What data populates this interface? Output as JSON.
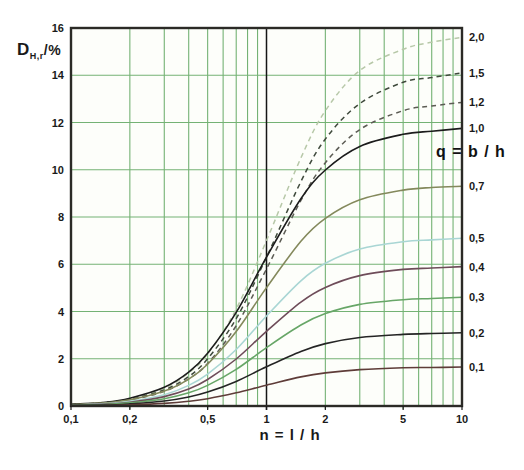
{
  "figure": {
    "y_axis": {
      "base": "D",
      "subscript": "H,r",
      "unit": "/%"
    },
    "x_axis_title": "n = l / h",
    "q_label": "q = b / h"
  },
  "chart_data": {
    "type": "line",
    "title": "",
    "xlabel": "n = l / h",
    "ylabel": "D_H,r /%",
    "x_scale": "log",
    "xlim": [
      0.1,
      10
    ],
    "ylim": [
      0,
      16
    ],
    "grid": {
      "on": true,
      "color": "#74b274",
      "x_minor": [
        0.2,
        0.3,
        0.4,
        0.5,
        0.6,
        0.7,
        0.8,
        0.9,
        2,
        3,
        4,
        5,
        6,
        7,
        8,
        9
      ],
      "x_dark": [
        1
      ],
      "y_lines": [
        2,
        4,
        6,
        8,
        10,
        12,
        14
      ],
      "dark_line_color": "#151515",
      "border_color": "#2b2a26",
      "plot_background": "#fdfefa"
    },
    "x_ticks": [
      {
        "value": 0.1,
        "label": "0,1"
      },
      {
        "value": 0.2,
        "label": "0,2"
      },
      {
        "value": 0.5,
        "label": "0,5"
      },
      {
        "value": 1,
        "label": "1"
      },
      {
        "value": 2,
        "label": "2"
      },
      {
        "value": 5,
        "label": "5"
      },
      {
        "value": 10,
        "label": "10"
      }
    ],
    "y_ticks": [
      {
        "value": 0,
        "label": "0"
      },
      {
        "value": 2,
        "label": "2"
      },
      {
        "value": 4,
        "label": "4"
      },
      {
        "value": 6,
        "label": "6"
      },
      {
        "value": 8,
        "label": "8"
      },
      {
        "value": 10,
        "label": "10"
      },
      {
        "value": 12,
        "label": "12"
      },
      {
        "value": 14,
        "label": "14"
      },
      {
        "value": 16,
        "label": "16"
      }
    ],
    "x": [
      0.1,
      0.15,
      0.2,
      0.3,
      0.4,
      0.5,
      0.7,
      1,
      1.5,
      2,
      3,
      5,
      7,
      10
    ],
    "series": [
      {
        "name": "2,0",
        "q": 2.0,
        "dashed": true,
        "color": "#b7c8a8",
        "values": [
          0.06,
          0.16,
          0.3,
          0.75,
          1.4,
          2.2,
          4.1,
          7.0,
          10.5,
          12.5,
          14.2,
          15.1,
          15.4,
          15.6
        ]
      },
      {
        "name": "1,5",
        "q": 1.5,
        "dashed": true,
        "color": "#3f4a3c",
        "values": [
          0.06,
          0.14,
          0.28,
          0.68,
          1.25,
          2.0,
          3.7,
          6.3,
          9.5,
          11.3,
          12.8,
          13.7,
          13.9,
          14.1
        ]
      },
      {
        "name": "1,2",
        "q": 1.2,
        "dashed": true,
        "color": "#5c5c54",
        "values": [
          0.05,
          0.13,
          0.25,
          0.62,
          1.15,
          1.8,
          3.4,
          5.8,
          8.7,
          10.3,
          11.7,
          12.5,
          12.7,
          12.85
        ]
      },
      {
        "name": "1,0",
        "q": 1.0,
        "dashed": false,
        "color": "#1c1c1c",
        "values": [
          0.07,
          0.16,
          0.33,
          0.79,
          1.43,
          2.23,
          3.96,
          6.3,
          8.77,
          9.99,
          10.99,
          11.5,
          11.63,
          11.75
        ]
      },
      {
        "name": "0,7",
        "q": 0.7,
        "dashed": false,
        "color": "#84895c",
        "values": [
          0.06,
          0.13,
          0.26,
          0.63,
          1.14,
          1.77,
          3.15,
          5.01,
          6.97,
          7.94,
          8.73,
          9.14,
          9.25,
          9.3
        ]
      },
      {
        "name": "0,5",
        "q": 0.5,
        "dashed": false,
        "color": "#a9d6d4",
        "values": [
          0.04,
          0.1,
          0.2,
          0.48,
          0.87,
          1.35,
          2.39,
          3.81,
          5.3,
          6.04,
          6.64,
          6.95,
          7.03,
          7.1
        ]
      },
      {
        "name": "0,4",
        "q": 0.4,
        "dashed": false,
        "color": "#6e4c59",
        "values": [
          0.04,
          0.08,
          0.16,
          0.4,
          0.72,
          1.12,
          1.99,
          3.16,
          4.4,
          5.02,
          5.52,
          5.78,
          5.84,
          5.9
        ]
      },
      {
        "name": "0,3",
        "q": 0.3,
        "dashed": false,
        "color": "#67a667",
        "values": [
          0.03,
          0.06,
          0.13,
          0.31,
          0.56,
          0.87,
          1.55,
          2.47,
          3.43,
          3.91,
          4.3,
          4.5,
          4.55,
          4.6
        ]
      },
      {
        "name": "0,2",
        "q": 0.2,
        "dashed": false,
        "color": "#242424",
        "values": [
          0.02,
          0.04,
          0.09,
          0.21,
          0.38,
          0.59,
          1.04,
          1.66,
          2.31,
          2.64,
          2.9,
          3.03,
          3.07,
          3.1
        ]
      },
      {
        "name": "0,1",
        "q": 0.1,
        "dashed": false,
        "color": "#5e3c38",
        "values": [
          0.01,
          0.02,
          0.05,
          0.11,
          0.2,
          0.31,
          0.56,
          0.88,
          1.23,
          1.4,
          1.54,
          1.62,
          1.63,
          1.65
        ]
      }
    ],
    "legend_position": "right-of-curves",
    "label_color": "#1a1a1a"
  }
}
